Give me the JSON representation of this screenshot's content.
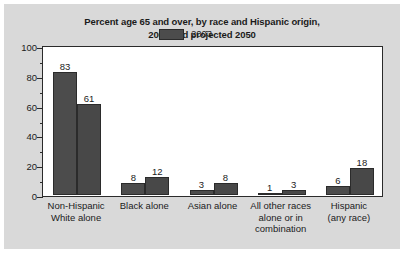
{
  "chart_data": {
    "type": "bar",
    "title": "Percent age 65 and over, by race and Hispanic origin, 2003 and projected 2050",
    "title_lines": [
      "Percent age 65 and over, by race and Hispanic origin,",
      "2003 and projected 2050"
    ],
    "xlabel": "",
    "ylabel": "",
    "ylim": [
      0,
      100
    ],
    "yticks": [
      0,
      20,
      40,
      60,
      80,
      100
    ],
    "ytick_labels": [
      "0",
      "20",
      "40",
      "60",
      "80",
      "100"
    ],
    "yminor_ticks": [
      10,
      30,
      50,
      70,
      90
    ],
    "grid": false,
    "legend_position": "upper center",
    "categories": [
      "Non-Hispanic White alone",
      "Black alone",
      "Asian alone",
      "All other races alone or in combination",
      "Hispanic (any race)"
    ],
    "category_label_lines": [
      [
        "Non-Hispanic",
        "White alone"
      ],
      [
        "Black alone"
      ],
      [
        "Asian alone"
      ],
      [
        "All other races",
        "alone or in",
        "combination"
      ],
      [
        "Hispanic",
        "(any race)"
      ]
    ],
    "series": [
      {
        "name": "2003",
        "values": [
          83,
          8,
          3,
          1,
          6
        ],
        "color": "#4c4c4c"
      },
      {
        "name": "2050, projected",
        "values": [
          61,
          12,
          8,
          3,
          18
        ],
        "color": "#484848"
      }
    ],
    "data_labels": [
      [
        "83",
        "61"
      ],
      [
        "8",
        "12"
      ],
      [
        "3",
        "8"
      ],
      [
        "1",
        "3"
      ],
      [
        "6",
        "18"
      ]
    ]
  },
  "legend": {
    "items": [
      {
        "label": "2003"
      },
      {
        "label": "2050, projected"
      }
    ]
  },
  "colors": {
    "figure_background": "#d9d9d9",
    "plot_background": "#ffffff",
    "axis": "#2b2b2b",
    "text": "#1b1b1b",
    "bar_2003": "#4c4c4c",
    "bar_2050": "#484848"
  }
}
